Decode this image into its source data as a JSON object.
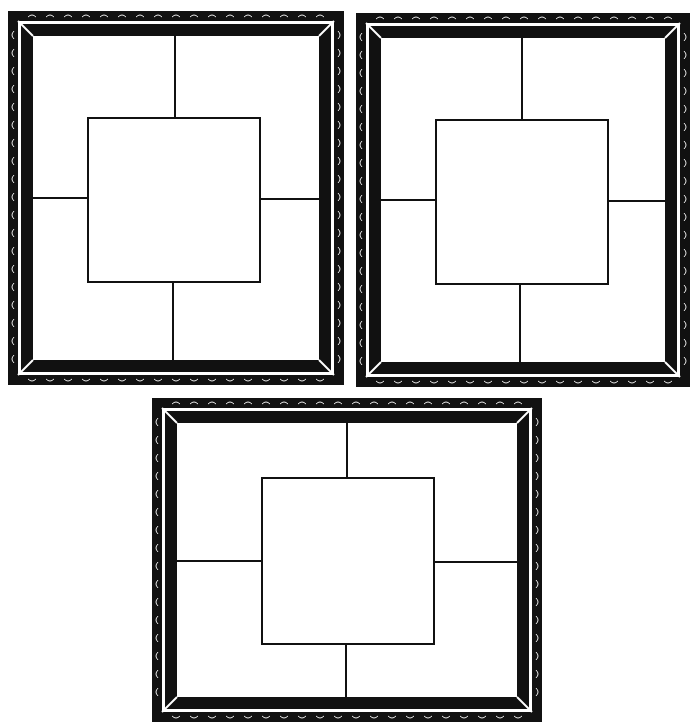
{
  "figure": {
    "colors": {
      "frame": "#111111",
      "background": "#ffffff",
      "line": "#111111",
      "highlight": "#ffffff"
    }
  },
  "frames": [
    {
      "id": "frame-top-left",
      "x": 8,
      "y": 11,
      "w": 336,
      "h": 374,
      "inner": {
        "x": 88,
        "y": 118,
        "w": 172,
        "h": 164
      },
      "vline_top_x": 175,
      "vline_bottom_x": 173,
      "hline_left_y": 198,
      "hline_right_y": 199
    },
    {
      "id": "frame-top-right",
      "x": 356,
      "y": 13,
      "w": 334,
      "h": 374,
      "inner": {
        "x": 436,
        "y": 120,
        "w": 172,
        "h": 164
      },
      "vline_top_x": 522,
      "vline_bottom_x": 520,
      "hline_left_y": 200,
      "hline_right_y": 201
    },
    {
      "id": "frame-bottom",
      "x": 152,
      "y": 398,
      "w": 390,
      "h": 324,
      "inner": {
        "x": 262,
        "y": 478,
        "w": 172,
        "h": 166
      },
      "vline_top_x": 347,
      "vline_bottom_x": 346,
      "hline_left_y": 561,
      "hline_right_y": 562
    }
  ]
}
